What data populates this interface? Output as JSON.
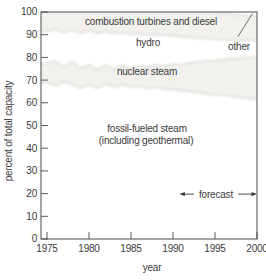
{
  "figure": {
    "axis": {
      "x_label": "year",
      "y_label": "percent of total capacity"
    },
    "region_labels": {
      "combustion": "combustion turbines and diesel",
      "hydro": "hydro",
      "other": "other",
      "nuclear": "nuclear steam",
      "fossil_line1": "fossil-fueled steam",
      "fossil_line2": "(including geothermal)"
    },
    "annotation": {
      "forecast": "forecast"
    }
  },
  "chart_data": {
    "type": "area",
    "title": "",
    "xlabel": "year",
    "ylabel": "percent of total capacity",
    "xlim": [
      1975,
      2000
    ],
    "ylim": [
      0,
      100
    ],
    "x_ticks": [
      1975,
      1980,
      1985,
      1990,
      1995,
      2000
    ],
    "y_ticks": [
      0,
      10,
      20,
      30,
      40,
      50,
      60,
      70,
      80,
      90,
      100
    ],
    "grid": false,
    "legend_position": "inside-labels",
    "stack_order_bottom_to_top": [
      "fossil-fueled steam (including geothermal)",
      "nuclear steam",
      "hydro",
      "combustion turbines and diesel",
      "other"
    ],
    "x": [
      1975,
      1976,
      1977,
      1978,
      1979,
      1980,
      1981,
      1982,
      1983,
      1984,
      1985,
      1986,
      1987,
      1988,
      1989,
      1990,
      1991,
      1992,
      1993,
      1994,
      1995,
      1996,
      1997,
      1998,
      1999,
      2000
    ],
    "series": [
      {
        "key": "fossil",
        "name": "fossil-fueled steam (including geothermal)",
        "boundary": "cumulative_top_percent",
        "values": [
          69,
          67.5,
          69.5,
          68,
          66.5,
          68,
          66.5,
          68.5,
          67,
          68,
          67,
          67.5,
          66.5,
          67,
          66,
          66,
          65.5,
          65,
          64.5,
          64,
          63.5,
          63.5,
          63,
          62.5,
          62,
          61.5
        ]
      },
      {
        "key": "nuclear",
        "name": "nuclear steam",
        "boundary": "cumulative_top_percent",
        "values": [
          77,
          78.5,
          75.5,
          78,
          75,
          76.5,
          74.5,
          76.5,
          74.5,
          76.5,
          75,
          76,
          75.5,
          76.5,
          76,
          77,
          76.5,
          77.5,
          78,
          78.5,
          78.5,
          79,
          79.5,
          79.5,
          80,
          80
        ]
      },
      {
        "key": "hydro",
        "name": "hydro",
        "boundary": "cumulative_top_percent",
        "values": [
          91.5,
          92.5,
          91,
          92,
          91,
          91.8,
          90.8,
          91.5,
          90.5,
          91,
          90.2,
          90.6,
          89.9,
          90.2,
          89.6,
          89.8,
          89.2,
          89,
          88.6,
          88.4,
          88.1,
          87.9,
          87.7,
          87.6,
          87.5,
          87.5
        ]
      },
      {
        "key": "combustion",
        "name": "combustion turbines and diesel",
        "boundary": "cumulative_top_percent",
        "values": [
          100,
          100,
          100,
          100,
          100,
          100,
          100,
          100,
          100,
          100,
          100,
          100,
          100,
          100,
          100,
          100,
          100,
          100,
          100,
          100,
          99.7,
          99.3,
          98.9,
          98.6,
          98.3,
          98.1
        ]
      },
      {
        "key": "other",
        "name": "other",
        "boundary": "cumulative_top_percent",
        "values": [
          100,
          100,
          100,
          100,
          100,
          100,
          100,
          100,
          100,
          100,
          100,
          100,
          100,
          100,
          100,
          100,
          100,
          100,
          100,
          100,
          100,
          100,
          100,
          100,
          100,
          100
        ]
      }
    ],
    "annotations": [
      {
        "text": "forecast",
        "y": 20,
        "x_start": 1991,
        "x_end": 2000,
        "style": "double-arrow"
      }
    ],
    "colors": {
      "region_fill": "#f2f1ee",
      "band_edge": "#e4e3df",
      "axis": "#4a4a4a",
      "text": "#3b3b3b",
      "background": "#ffffff"
    }
  }
}
